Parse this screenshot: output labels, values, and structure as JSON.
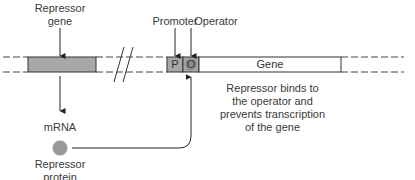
{
  "diagram": {
    "labels": {
      "repressor_gene_line1": "Repressor",
      "repressor_gene_line2": "gene",
      "promoter": "Promoter",
      "operator": "Operator",
      "mrna": "mRNA",
      "repressor_protein_line1": "Repressor",
      "repressor_protein_line2": "protein",
      "gene": "Gene",
      "p_box": "P",
      "o_box": "O"
    },
    "annotation": {
      "line1": "Repressor binds to",
      "line2": "the operator and",
      "line3": "prevents transcription",
      "line4": "of the gene"
    },
    "colors": {
      "box_fill": "#a8a8a8",
      "protein_fill": "#999999",
      "line": "#333333"
    }
  }
}
